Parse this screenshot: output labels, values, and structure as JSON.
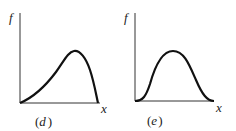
{
  "panels": [
    {
      "id": "d",
      "caption_open": "(",
      "caption_letter": "d",
      "caption_close": ")",
      "y_label": "f",
      "x_label": "x",
      "curve": "left-skewed hump rising slowly from origin, peak near 70% of x-range, dropping steeply to zero"
    },
    {
      "id": "e",
      "caption_open": "(",
      "caption_letter": "e",
      "caption_close": ")",
      "y_label": "f",
      "x_label": "x",
      "curve": "symmetric bell-shaped hump starting at origin, peak near center, returning to zero"
    }
  ]
}
